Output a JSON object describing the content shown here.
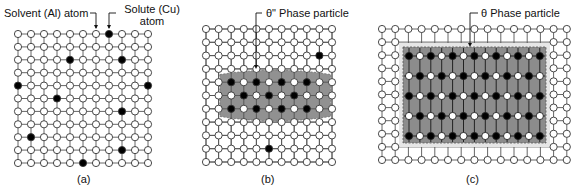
{
  "figure": {
    "panels": [
      {
        "id": "a",
        "caption": "(a)",
        "grid": {
          "cols": 11,
          "rows": 11,
          "x0": 18,
          "y0": 34,
          "dx": 13.0,
          "dy": 12.9
        },
        "solute_atoms": [
          [
            7,
            0
          ],
          [
            4,
            2
          ],
          [
            8,
            2
          ],
          [
            0,
            4
          ],
          [
            10,
            4
          ],
          [
            3,
            5
          ],
          [
            8,
            6
          ],
          [
            1,
            8
          ],
          [
            8,
            9
          ],
          [
            5,
            10
          ]
        ],
        "annotations": [
          {
            "text": "Solvent (Al) atom",
            "points_to": [
              6,
              0
            ]
          },
          {
            "text_line1": "Solute (Cu)",
            "text_line2": "atom",
            "points_to": [
              7,
              0
            ]
          }
        ]
      },
      {
        "id": "b",
        "caption": "(b)",
        "grid": {
          "cols": 11,
          "rows": 11,
          "x0": 206,
          "y0": 29,
          "dx": 12.6,
          "dy": 13.3
        },
        "solute_atoms": [
          [
            9,
            2
          ],
          [
            5,
            9
          ]
        ],
        "particle": {
          "label": "θ\" Phase particle",
          "type": "coherent (θ\")",
          "rows": [
            4,
            6
          ],
          "cols": [
            2,
            9
          ],
          "solute_pattern": {
            "4": [
              2,
              4,
              6,
              8
            ],
            "5": [
              3,
              5,
              7
            ],
            "6": [
              2,
              4,
              6,
              8
            ]
          }
        }
      },
      {
        "id": "c",
        "caption": "(c)",
        "grid": {
          "cols": 15,
          "rows": 11,
          "x0": 382,
          "y0": 29,
          "dx": 13.2,
          "dy": 13.1
        },
        "particle": {
          "label": "θ Phase particle",
          "type": "incoherent (θ)",
          "box": {
            "x": 403,
            "y": 47,
            "w": 143,
            "h": 96
          },
          "inner_lattice": {
            "cols": 13,
            "rows": 5,
            "x0": 409,
            "y0": 56,
            "dx": 10.9,
            "dy": 20
          },
          "pattern": "checkerboard, rows 0/2/4 start with solute"
        }
      }
    ],
    "legend": {
      "solvent": "Solvent (Al) atom",
      "solute": "Solute (Cu) atom"
    },
    "colors": {
      "line": "#555555",
      "solvent_fill": "#ffffff",
      "solute_fill": "#000000",
      "particle_fill": "#8c8c8c",
      "particle_halo": "#b4b4b4"
    }
  }
}
